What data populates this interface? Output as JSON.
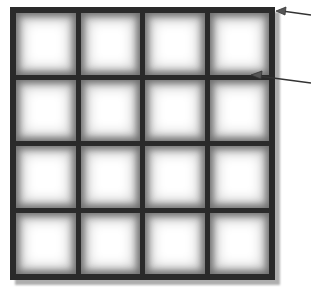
{
  "diagram": {
    "type": "grid",
    "rows": 4,
    "columns": 4,
    "cells": [
      [
        "",
        "",
        "",
        ""
      ],
      [
        "",
        "",
        "",
        ""
      ],
      [
        "",
        "",
        "",
        ""
      ],
      [
        "",
        "",
        "",
        ""
      ]
    ],
    "colors": {
      "frame": "#2a2a2a",
      "cell_fill": "#ffffff",
      "cell_edge_shade": "#6e6e6e",
      "shadow": "#9a9a9a",
      "arrow": "#333333"
    },
    "annotations": [
      {
        "id": "arrow-outer-frame",
        "target": "outer frame top-right corner",
        "label": ""
      },
      {
        "id": "arrow-inner-gridline",
        "target": "first horizontal gridline at right edge",
        "label": ""
      }
    ]
  }
}
